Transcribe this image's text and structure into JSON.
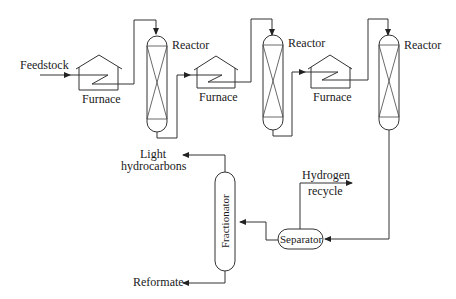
{
  "diagram": {
    "type": "process-flow",
    "labels": {
      "feedstock": "Feedstock",
      "furnace1": "Furnace",
      "furnace2": "Furnace",
      "furnace3": "Furnace",
      "reactor1": "Reactor",
      "reactor2": "Reactor",
      "reactor3": "Reactor",
      "light_hc_1": "Light",
      "light_hc_2": "hydrocarbons",
      "hydrogen_1": "Hydrogen",
      "hydrogen_2": "recycle",
      "separator": "Separator",
      "fractionator": "Fractionator",
      "reformate": "Reformate"
    },
    "nodes": [
      "Feedstock",
      "Furnace",
      "Reactor",
      "Furnace",
      "Reactor",
      "Furnace",
      "Reactor",
      "Separator",
      "Fractionator",
      "Light hydrocarbons",
      "Hydrogen recycle",
      "Reformate"
    ],
    "edges": [
      [
        "Feedstock",
        "Furnace 1"
      ],
      [
        "Furnace 1",
        "Reactor 1"
      ],
      [
        "Reactor 1",
        "Furnace 2"
      ],
      [
        "Furnace 2",
        "Reactor 2"
      ],
      [
        "Reactor 2",
        "Furnace 3"
      ],
      [
        "Furnace 3",
        "Reactor 3"
      ],
      [
        "Reactor 3",
        "Separator"
      ],
      [
        "Separator",
        "Hydrogen recycle"
      ],
      [
        "Separator",
        "Fractionator"
      ],
      [
        "Fractionator",
        "Light hydrocarbons"
      ],
      [
        "Fractionator",
        "Reformate"
      ]
    ]
  }
}
